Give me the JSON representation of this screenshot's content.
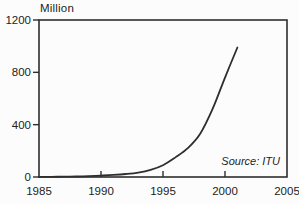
{
  "chart_data": {
    "type": "line",
    "title": "",
    "ylabel": "Million",
    "xlabel": "",
    "source_note": "Source: ITU",
    "xlim": [
      1985,
      2005
    ],
    "ylim": [
      0,
      1200
    ],
    "x_ticks": [
      1985,
      1990,
      1995,
      2000,
      2005
    ],
    "y_ticks": [
      0,
      400,
      800,
      1200
    ],
    "grid": false,
    "legend": "none",
    "line_color": "#2e2e2e",
    "axis_color": "#2e2e2e",
    "text_color": "#1c1c1c",
    "background": "#fcfcfc",
    "series": [
      {
        "name": "",
        "x": [
          1985,
          1986,
          1987,
          1988,
          1989,
          1990,
          1991,
          1992,
          1993,
          1994,
          1995,
          1996,
          1997,
          1998,
          1999,
          2000,
          2001
        ],
        "y": [
          1,
          1.5,
          2.5,
          4,
          7,
          11,
          16,
          23,
          34,
          55,
          90,
          150,
          220,
          330,
          520,
          760,
          990
        ]
      }
    ]
  }
}
